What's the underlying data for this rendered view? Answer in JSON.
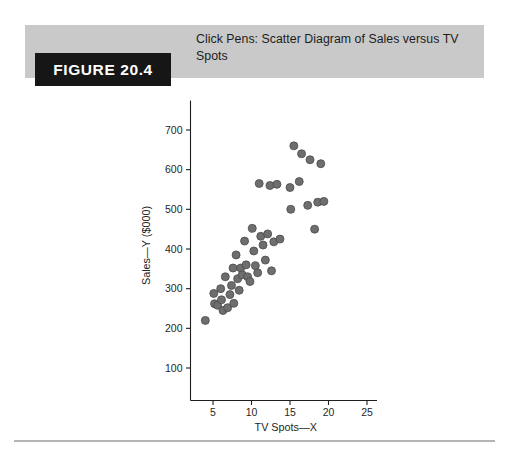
{
  "figure": {
    "label": "FIGURE 20.4",
    "title": "Click Pens: Scatter Diagram of Sales versus TV Spots"
  },
  "colors": {
    "header_band": "#c9c9c9",
    "label_box": "#161616",
    "label_text": "#ffffff",
    "point_fill": "#6e6e6e",
    "point_stroke": "#4a4a4a",
    "axis": "#1f1f1f",
    "rule": "#b4b4b4"
  },
  "chart_data": {
    "type": "scatter",
    "title": "Click Pens: Scatter Diagram of Sales versus TV Spots",
    "xlabel": "TV Spots—X",
    "ylabel": "Sales—Y ($000)",
    "xlim": [
      0,
      26
    ],
    "ylim": [
      0,
      740
    ],
    "xticks": [
      5,
      10,
      15,
      20,
      25
    ],
    "yticks": [
      100,
      200,
      300,
      400,
      500,
      600,
      700
    ],
    "xtick_labels": [
      "5",
      "10",
      "15",
      "20",
      "25"
    ],
    "ytick_labels": [
      "100",
      "200",
      "300",
      "400",
      "500",
      "600",
      "700"
    ],
    "grid": false,
    "legend": false,
    "marker": {
      "shape": "circle",
      "size": 8,
      "fill": "#6e6e6e",
      "edge": "#4a4a4a"
    },
    "series": [
      {
        "name": "Sales vs TV Spots",
        "points": [
          [
            4.0,
            220
          ],
          [
            5.1,
            288
          ],
          [
            5.2,
            262
          ],
          [
            5.6,
            258
          ],
          [
            6.0,
            300
          ],
          [
            6.1,
            272
          ],
          [
            6.3,
            245
          ],
          [
            6.6,
            330
          ],
          [
            6.9,
            252
          ],
          [
            7.2,
            285
          ],
          [
            7.4,
            308
          ],
          [
            7.6,
            352
          ],
          [
            7.7,
            263
          ],
          [
            8.0,
            385
          ],
          [
            8.2,
            325
          ],
          [
            8.4,
            296
          ],
          [
            8.6,
            352
          ],
          [
            8.8,
            335
          ],
          [
            9.1,
            420
          ],
          [
            9.3,
            360
          ],
          [
            9.5,
            330
          ],
          [
            9.8,
            318
          ],
          [
            10.1,
            452
          ],
          [
            10.3,
            395
          ],
          [
            10.5,
            358
          ],
          [
            10.8,
            340
          ],
          [
            11.0,
            565
          ],
          [
            11.2,
            432
          ],
          [
            11.5,
            410
          ],
          [
            11.8,
            372
          ],
          [
            12.1,
            438
          ],
          [
            12.4,
            560
          ],
          [
            12.6,
            345
          ],
          [
            12.9,
            418
          ],
          [
            13.3,
            563
          ],
          [
            13.7,
            425
          ],
          [
            15.0,
            555
          ],
          [
            15.1,
            500
          ],
          [
            15.5,
            660
          ],
          [
            16.2,
            570
          ],
          [
            16.5,
            640
          ],
          [
            17.3,
            510
          ],
          [
            17.6,
            625
          ],
          [
            18.2,
            450
          ],
          [
            18.6,
            518
          ],
          [
            19.0,
            615
          ],
          [
            19.4,
            520
          ]
        ]
      }
    ]
  }
}
